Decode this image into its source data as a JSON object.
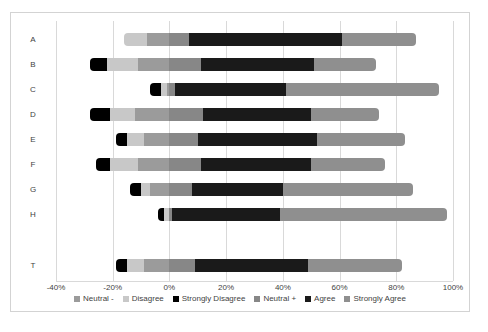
{
  "chart_data": {
    "type": "bar",
    "subtype": "diverging-stacked-likert",
    "title": "",
    "categories": [
      "A",
      "B",
      "C",
      "D",
      "E",
      "F",
      "G",
      "H",
      "T"
    ],
    "series": [
      {
        "name": "Strongly Disagree",
        "color": "#000000",
        "side": "negative",
        "values": [
          0,
          -6,
          -4,
          -7,
          -4,
          -5,
          -4,
          -2,
          -4
        ]
      },
      {
        "name": "Disagree",
        "color": "#c8c8c8",
        "side": "negative",
        "values": [
          -8,
          -11,
          -2,
          -9,
          -6,
          -10,
          -3,
          -2,
          -6
        ]
      },
      {
        "name": "Neutral -",
        "color": "#9b9b9b",
        "side": "negative",
        "values": [
          -8,
          -11,
          -1,
          -12,
          -9,
          -11,
          -7,
          0,
          -9
        ]
      },
      {
        "name": "Neutral +",
        "color": "#878787",
        "side": "positive",
        "values": [
          7,
          11,
          2,
          12,
          10,
          11,
          8,
          1,
          9
        ]
      },
      {
        "name": "Agree",
        "color": "#1a1a1a",
        "side": "positive",
        "values": [
          54,
          40,
          39,
          38,
          42,
          39,
          32,
          38,
          40
        ]
      },
      {
        "name": "Strongly Agree",
        "color": "#8f8f8f",
        "side": "positive",
        "values": [
          26,
          22,
          54,
          24,
          31,
          26,
          46,
          59,
          33
        ]
      }
    ],
    "legend": {
      "position": "bottom",
      "order": [
        "Neutral -",
        "Disagree",
        "Strongly Disagree",
        "Neutral +",
        "Agree",
        "Strongly Agree"
      ]
    },
    "x_axis": {
      "range": [
        -40,
        100
      ],
      "tick_values": [
        -40,
        -20,
        0,
        20,
        40,
        60,
        80,
        100
      ],
      "tick_labels": [
        "-40%",
        "-20%",
        "0%",
        "20%",
        "40%",
        "60%",
        "80%",
        "100%"
      ],
      "grid": true
    },
    "xlabel": "",
    "ylabel": ""
  },
  "colors": {
    "background": "#ffffff",
    "frame_border": "#d3d3d3",
    "gridline": "#d9d9d9",
    "text": "#3f3f3f"
  }
}
